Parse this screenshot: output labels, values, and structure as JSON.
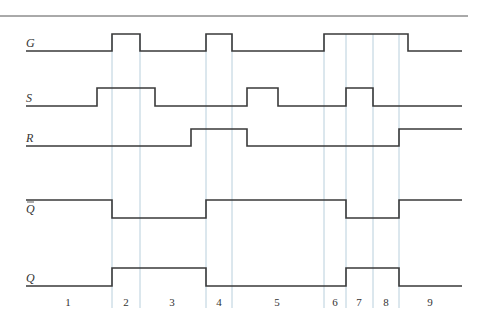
{
  "diagram": {
    "type": "timing-diagram",
    "x_start": 26,
    "x_end": 462,
    "top_rule": {
      "x1": 0,
      "x2": 468,
      "y": 16
    },
    "signals": [
      {
        "name": "G",
        "label": "G",
        "overbar": false,
        "y_high": 34,
        "y_low": 51,
        "initial": 0,
        "transitions": [
          112,
          140,
          206,
          232,
          324,
          408
        ]
      },
      {
        "name": "S",
        "label": "S",
        "overbar": false,
        "y_high": 88,
        "y_low": 106,
        "initial": 0,
        "transitions": [
          97,
          155,
          247,
          278,
          346,
          373
        ]
      },
      {
        "name": "R",
        "label": "R",
        "overbar": false,
        "y_high": 129,
        "y_low": 146,
        "initial": 0,
        "transitions": [
          191,
          247,
          399
        ]
      },
      {
        "name": "Q_bar",
        "label": "Q",
        "overbar": true,
        "y_high": 200,
        "y_low": 218,
        "initial": 1,
        "transitions": [
          112,
          206,
          346,
          399
        ]
      },
      {
        "name": "Q",
        "label": "Q",
        "overbar": false,
        "y_high": 268,
        "y_low": 286,
        "initial": 0,
        "transitions": [
          112,
          206,
          346,
          399
        ]
      }
    ],
    "vertical_lines": {
      "x": [
        112,
        140,
        206,
        232,
        324,
        346,
        373,
        399
      ],
      "y_top": 34,
      "y_bottom": 308,
      "color": "#b8cfdc"
    },
    "intervals": [
      {
        "label": "1",
        "x": 68
      },
      {
        "label": "2",
        "x": 126
      },
      {
        "label": "3",
        "x": 172
      },
      {
        "label": "4",
        "x": 219
      },
      {
        "label": "5",
        "x": 277
      },
      {
        "label": "6",
        "x": 335
      },
      {
        "label": "7",
        "x": 359
      },
      {
        "label": "8",
        "x": 386
      },
      {
        "label": "9",
        "x": 430
      }
    ],
    "interval_label_y": 306
  }
}
